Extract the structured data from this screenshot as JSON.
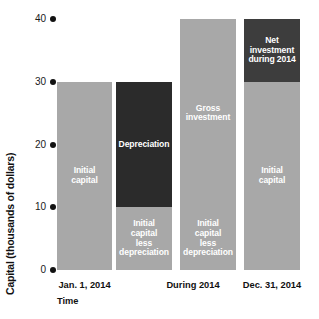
{
  "chart_data": {
    "type": "bar",
    "title": "",
    "subtitle": "",
    "xlabel": "Time",
    "ylabel": "Capital (thousands of dollars)",
    "ylim": [
      0,
      40
    ],
    "yticks": [
      0,
      10,
      20,
      30,
      40
    ],
    "ytick_labels": [
      "0",
      "10",
      "20",
      "30",
      "40"
    ],
    "grid": false,
    "legend": "none",
    "categories": [
      "Jan. 1, 2014",
      "During 2014",
      "Dec. 31, 2014"
    ],
    "xtick_labels": [
      "Jan. 1, 2014",
      "During 2014",
      "Dec. 31, 2014"
    ],
    "bars": [
      {
        "id": "bar-initial-capital",
        "category": "Jan. 1, 2014",
        "total": 30,
        "segments": [
          {
            "id": "seg-initial-capital",
            "label": "Initial\ncapital",
            "y0": 0,
            "y1": 30,
            "value": 30,
            "color": "#a8a8a8",
            "label_color": "#ffffff"
          }
        ]
      },
      {
        "id": "bar-depreciation",
        "category": "During 2014",
        "total": 30,
        "segments": [
          {
            "id": "seg-initial-capital-less-depreciation-1",
            "label": "Initial\ncapital\nless\ndepreciation",
            "y0": 0,
            "y1": 10,
            "value": 10,
            "color": "#a8a8a8",
            "label_color": "#ffffff"
          },
          {
            "id": "seg-depreciation",
            "label": "Depreciation",
            "y0": 10,
            "y1": 30,
            "value": 20,
            "color": "#2b2b2b",
            "label_color": "#ffffff"
          }
        ]
      },
      {
        "id": "bar-gross-investment",
        "category": "During 2014",
        "total": 40,
        "segments": [
          {
            "id": "seg-initial-capital-less-depreciation-2",
            "label": "Initial\ncapital\nless\ndepreciation",
            "y0": 0,
            "y1": 10,
            "value": 10,
            "color": "#a8a8a8",
            "label_color": "#ffffff"
          },
          {
            "id": "seg-gross-investment",
            "label": "Gross\ninvestment",
            "y0": 10,
            "y1": 40,
            "value": 30,
            "color": "#a8a8a8",
            "label_color": "#ffffff"
          }
        ]
      },
      {
        "id": "bar-net-investment",
        "category": "Dec. 31, 2014",
        "total": 40,
        "segments": [
          {
            "id": "seg-initial-capital-end",
            "label": "Initial\ncapital",
            "y0": 0,
            "y1": 30,
            "value": 30,
            "color": "#a8a8a8",
            "label_color": "#ffffff"
          },
          {
            "id": "seg-net-investment",
            "label": "Net\ninvestment\nduring 2014",
            "y0": 30,
            "y1": 40,
            "value": 10,
            "color": "#3d3d3d",
            "label_color": "#ffffff"
          }
        ]
      }
    ],
    "colors": {
      "light_gray": "#a8a8a8",
      "dark": "#2b2b2b",
      "net_investment": "#3d3d3d",
      "axis_text": "#111111",
      "background": "#ffffff"
    }
  }
}
